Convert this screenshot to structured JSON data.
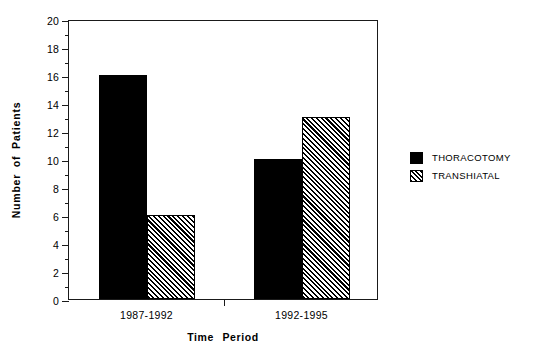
{
  "chart_data": {
    "type": "bar",
    "title": "",
    "xlabel": "Time  Period",
    "ylabel": "Number  of  Patients",
    "categories": [
      "1987-1992",
      "1992-1995"
    ],
    "series": [
      {
        "name": "THORACOTOMY",
        "pattern": "solid",
        "values": [
          16,
          10
        ]
      },
      {
        "name": "TRANSHIATAL",
        "pattern": "hatched",
        "values": [
          6,
          13
        ]
      }
    ],
    "ylim": [
      0,
      20
    ],
    "ytick_step": 2,
    "yticks": [
      "0",
      "2",
      "4",
      "6",
      "8",
      "10",
      "12",
      "14",
      "16",
      "18",
      "20"
    ],
    "minor_ticks": true,
    "grid": false,
    "legend_position": "right-outside",
    "frame": "box",
    "color": "#000000"
  },
  "axes": {
    "y_title": "Number  of  Patients",
    "x_title": "Time  Period"
  },
  "legend": {
    "items": [
      {
        "label": "THORACOTOMY",
        "pattern": "solid"
      },
      {
        "label": "TRANSHIATAL",
        "pattern": "hatched"
      }
    ]
  }
}
